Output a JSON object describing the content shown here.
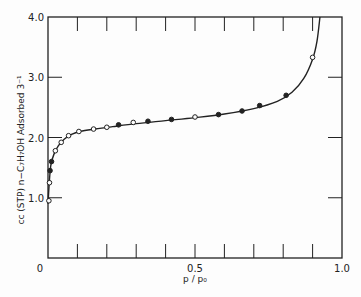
{
  "chart_data": {
    "type": "line",
    "title": "",
    "xlabel": "p / p₀",
    "ylabel": "cc (STP) n−C₇H₇OH Adsorbed 3⁻¹",
    "xlim": [
      0,
      1.0
    ],
    "ylim": [
      0,
      4.0
    ],
    "x_tick_labels": [
      "0",
      "0.5",
      "1.0"
    ],
    "y_tick_labels": [
      "0",
      "1.0",
      "2.0",
      "3.0",
      "4.0"
    ],
    "x_minor_ticks": [
      0.1,
      0.2,
      0.3,
      0.4,
      0.5,
      0.6,
      0.7,
      0.8,
      0.9
    ],
    "grid": false,
    "legend": null,
    "series": [
      {
        "name": "measured points",
        "marker": "circle",
        "points": [
          {
            "x": 0.003,
            "y": 0.95,
            "filled": false
          },
          {
            "x": 0.005,
            "y": 1.25,
            "filled": false
          },
          {
            "x": 0.007,
            "y": 1.45,
            "filled": true
          },
          {
            "x": 0.012,
            "y": 1.6,
            "filled": true
          },
          {
            "x": 0.025,
            "y": 1.78,
            "filled": false
          },
          {
            "x": 0.045,
            "y": 1.92,
            "filled": false
          },
          {
            "x": 0.07,
            "y": 2.03,
            "filled": false
          },
          {
            "x": 0.105,
            "y": 2.1,
            "filled": false
          },
          {
            "x": 0.155,
            "y": 2.14,
            "filled": false
          },
          {
            "x": 0.2,
            "y": 2.17,
            "filled": false
          },
          {
            "x": 0.24,
            "y": 2.21,
            "filled": true
          },
          {
            "x": 0.29,
            "y": 2.25,
            "filled": false
          },
          {
            "x": 0.34,
            "y": 2.27,
            "filled": true
          },
          {
            "x": 0.42,
            "y": 2.3,
            "filled": true
          },
          {
            "x": 0.5,
            "y": 2.34,
            "filled": false
          },
          {
            "x": 0.58,
            "y": 2.38,
            "filled": true
          },
          {
            "x": 0.66,
            "y": 2.44,
            "filled": true
          },
          {
            "x": 0.72,
            "y": 2.53,
            "filled": true
          },
          {
            "x": 0.81,
            "y": 2.7,
            "filled": true
          },
          {
            "x": 0.9,
            "y": 3.33,
            "filled": false
          }
        ]
      },
      {
        "name": "fitted curve",
        "marker": "none",
        "points": [
          {
            "x": 0.0,
            "y": 0.9
          },
          {
            "x": 0.005,
            "y": 1.3
          },
          {
            "x": 0.01,
            "y": 1.55
          },
          {
            "x": 0.02,
            "y": 1.72
          },
          {
            "x": 0.035,
            "y": 1.86
          },
          {
            "x": 0.055,
            "y": 1.97
          },
          {
            "x": 0.08,
            "y": 2.05
          },
          {
            "x": 0.11,
            "y": 2.1
          },
          {
            "x": 0.16,
            "y": 2.14
          },
          {
            "x": 0.22,
            "y": 2.18
          },
          {
            "x": 0.3,
            "y": 2.23
          },
          {
            "x": 0.4,
            "y": 2.28
          },
          {
            "x": 0.5,
            "y": 2.33
          },
          {
            "x": 0.6,
            "y": 2.39
          },
          {
            "x": 0.7,
            "y": 2.48
          },
          {
            "x": 0.78,
            "y": 2.6
          },
          {
            "x": 0.83,
            "y": 2.75
          },
          {
            "x": 0.87,
            "y": 2.98
          },
          {
            "x": 0.9,
            "y": 3.3
          },
          {
            "x": 0.915,
            "y": 3.6
          },
          {
            "x": 0.925,
            "y": 4.0
          }
        ]
      }
    ]
  }
}
